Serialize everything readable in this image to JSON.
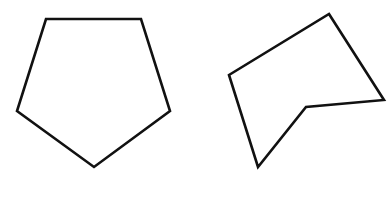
{
  "figure": {
    "width": 390,
    "height": 197,
    "background": "#ffffff",
    "stroke_color": "#111111",
    "stroke_width": 2.6,
    "shapes": [
      {
        "name": "regular-pentagon",
        "kind": "convex pentagon",
        "points": "46,19 141,19 170,111 94,167 17,111"
      },
      {
        "name": "irregular-pentagon",
        "kind": "concave pentagon",
        "points": "329,14 384,100 306,107 258,167 229,75"
      }
    ]
  }
}
